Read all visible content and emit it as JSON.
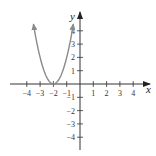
{
  "chart_data": {
    "type": "line",
    "title": "",
    "xlabel": "x",
    "ylabel": "y",
    "xlim": [
      -4.5,
      4.5
    ],
    "ylim": [
      -5,
      5
    ],
    "grid": false,
    "x_ticks": [
      -4,
      -3,
      -2,
      -1,
      1,
      2,
      3,
      4
    ],
    "y_ticks": [
      -4,
      -3,
      -2,
      -1,
      1,
      2,
      3,
      4
    ],
    "x_tick_labels": [
      "−4",
      "−3",
      "−2",
      "−1",
      "1",
      "2",
      "3",
      "4"
    ],
    "y_tick_labels": [
      "−4",
      "−3",
      "−2",
      "−1",
      "1",
      "2",
      "3",
      "4"
    ],
    "series": [
      {
        "name": "parabola",
        "description": "Upward-opening parabola with vertex at (-2, 0), arrows on both ends",
        "vertex": [
          -2,
          0
        ],
        "x": [
          -3.5,
          -3.25,
          -3,
          -2.75,
          -2.5,
          -2.25,
          -2,
          -1.75,
          -1.5,
          -1.25,
          -1,
          -0.75,
          -0.5
        ],
        "y": [
          4.5,
          3.13,
          2,
          1.13,
          0.5,
          0.13,
          0,
          0.13,
          0.5,
          1.13,
          2,
          3.13,
          4.5
        ]
      }
    ]
  },
  "labels": {
    "x_axis": "x",
    "y_axis": "y"
  },
  "colors": {
    "curve": "#8a8a8a",
    "axes": "#333333"
  }
}
